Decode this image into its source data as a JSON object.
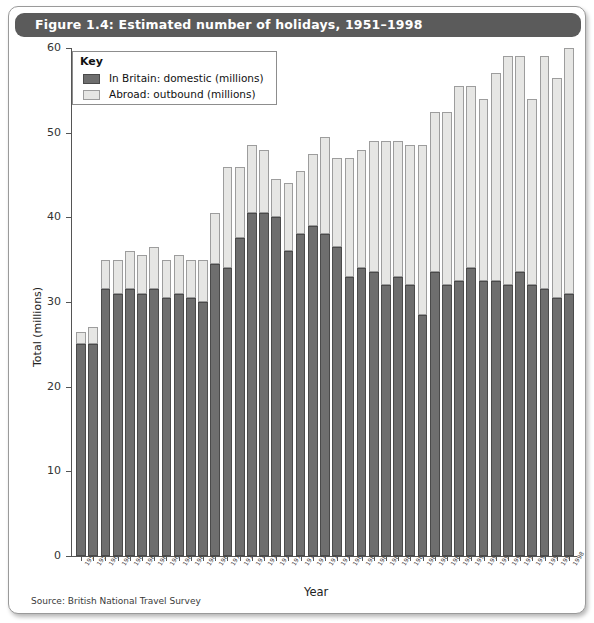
{
  "figure": {
    "title": "Figure 1.4: Estimated number of holidays, 1951–1998",
    "source": "Source: British National Travel Survey"
  },
  "legend": {
    "title": "Key",
    "items": [
      {
        "label": "In Britain: domestic (millions)",
        "color": "#6e6e6e"
      },
      {
        "label": "Abroad: outbound (millions)",
        "color": "#e6e6e4"
      }
    ]
  },
  "chart_data": {
    "type": "bar",
    "stacked": true,
    "title": "Figure 1.4: Estimated number of holidays, 1951–1998",
    "xlabel": "Year",
    "ylabel": "Total (millions)",
    "ylim": [
      0,
      60
    ],
    "yticks": [
      0,
      10,
      20,
      30,
      40,
      50,
      60
    ],
    "grid": false,
    "legend_position": "top-left",
    "categories": [
      "1951",
      "1955",
      "1960",
      "1961",
      "1962",
      "1963",
      "1964",
      "1965",
      "1966",
      "1967",
      "1968",
      "1969",
      "1970",
      "1971",
      "1972",
      "1973",
      "1974",
      "1975",
      "1976",
      "1977",
      "1978",
      "1979",
      "1980",
      "1981",
      "1982",
      "1983",
      "1984",
      "1985",
      "1986",
      "1987",
      "1988",
      "1989",
      "1990",
      "1991",
      "1992",
      "1993",
      "1994",
      "1995",
      "1996",
      "1997",
      "1998"
    ],
    "series": [
      {
        "name": "In Britain: domestic (millions)",
        "color": "#6e6e6e",
        "values": [
          25.0,
          25.0,
          31.5,
          31.0,
          31.5,
          31.0,
          31.5,
          30.5,
          31.0,
          30.5,
          30.0,
          34.5,
          34.0,
          37.5,
          40.5,
          40.5,
          40.0,
          36.0,
          38.0,
          39.0,
          38.0,
          36.5,
          33.0,
          34.0,
          33.5,
          32.0,
          33.0,
          32.0,
          28.5,
          33.5,
          32.0,
          32.5,
          34.0,
          32.5,
          32.5,
          32.0,
          33.5,
          32.0,
          31.5,
          30.5,
          31.0
        ]
      },
      {
        "name": "Abroad: outbound (millions)",
        "color": "#e6e6e4",
        "values": [
          1.5,
          2.0,
          3.5,
          4.0,
          4.5,
          4.5,
          5.0,
          4.5,
          4.5,
          4.5,
          5.0,
          6.0,
          12.0,
          8.5,
          8.0,
          7.5,
          4.5,
          8.0,
          7.5,
          8.5,
          11.5,
          10.5,
          14.0,
          14.0,
          15.5,
          17.0,
          16.0,
          16.5,
          20.0,
          19.0,
          20.5,
          23.0,
          21.5,
          21.5,
          24.5,
          27.0,
          25.5,
          22.0,
          27.5,
          26.0,
          29.0
        ]
      }
    ],
    "totals": [
      26.5,
      27.0,
      35.0,
      35.0,
      36.0,
      35.5,
      36.5,
      35.0,
      35.5,
      35.0,
      35.0,
      40.5,
      46.0,
      46.0,
      48.5,
      48.0,
      44.5,
      44.0,
      45.5,
      47.5,
      49.5,
      47.0,
      47.0,
      48.0,
      49.0,
      49.0,
      49.0,
      48.5,
      48.5,
      52.5,
      52.5,
      55.5,
      55.5,
      54.0,
      57.0,
      59.0,
      59.0,
      54.0,
      59.0,
      56.5,
      60.0
    ]
  }
}
